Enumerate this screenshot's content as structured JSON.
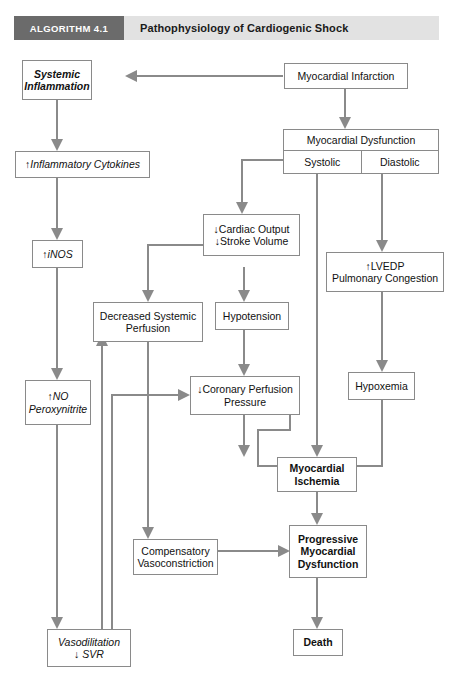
{
  "header": {
    "tag": "ALGORITHM 4.1",
    "title": "Pathophysiology of Cardiogenic Shock",
    "tag_bg": "#6b6b6b",
    "band_bg": "#e2e2e2"
  },
  "theme": {
    "box_border": "#8a8a8a",
    "arrow_color": "#8a8a8a",
    "text_color": "#111111",
    "page_bg": "#ffffff"
  },
  "nodes": {
    "myocardial_infarction": {
      "lines": [
        "Myocardial Infarction"
      ]
    },
    "systemic_inflammation": {
      "lines": [
        "Systemic",
        "Inflammation"
      ]
    },
    "inflammatory_cytokines": {
      "lines": [
        "↑Inflammatory Cytokines"
      ]
    },
    "inos": {
      "lines": [
        "↑iNOS"
      ]
    },
    "no_peroxynitrite": {
      "lines": [
        "↑NO",
        "Peroxynitrite"
      ]
    },
    "vasodilitation": {
      "lines": [
        "Vasodilitation",
        "↓ SVR"
      ]
    },
    "myocardial_dysfunction": {
      "title": "Myocardial Dysfunction",
      "left_cell": "Systolic",
      "right_cell": "Diastolic"
    },
    "cardiac_output": {
      "lines": [
        "↓Cardiac Output",
        "↓Stroke Volume"
      ]
    },
    "lvedp": {
      "lines": [
        "↑LVEDP",
        "Pulmonary Congestion"
      ]
    },
    "decreased_perfusion": {
      "lines": [
        "Decreased Systemic",
        "Perfusion"
      ]
    },
    "hypotension": {
      "lines": [
        "Hypotension"
      ]
    },
    "hypoxemia": {
      "lines": [
        "Hypoxemia"
      ]
    },
    "coronary_perfusion": {
      "lines": [
        "↓Coronary Perfusion",
        "Pressure"
      ]
    },
    "myocardial_ischemia": {
      "lines": [
        "Myocardial",
        "Ischemia"
      ]
    },
    "compensatory_vaso": {
      "lines": [
        "Compensatory",
        "Vasoconstriction"
      ]
    },
    "progressive_dysfunction": {
      "lines": [
        "Progressive",
        "Myocardial",
        "Dysfunction"
      ]
    },
    "death": {
      "lines": [
        "Death"
      ]
    }
  },
  "flow_edges": [
    "Myocardial Infarction → Systemic Inflammation",
    "Myocardial Infarction → Myocardial Dysfunction",
    "Systemic Inflammation → ↑Inflammatory Cytokines",
    "↑Inflammatory Cytokines → ↑iNOS",
    "↑iNOS → ↑NO Peroxynitrite",
    "↑NO Peroxynitrite → Vasodilitation ↓ SVR",
    "Systolic → ↓Cardiac Output ↓Stroke Volume",
    "Systolic → Myocardial Ischemia",
    "Diastolic → ↑LVEDP Pulmonary Congestion",
    "↓Cardiac Output → Decreased Systemic Perfusion",
    "↓Cardiac Output → Hypotension",
    "↑LVEDP Pulmonary Congestion → Hypoxemia",
    "Hypotension → ↓Coronary Perfusion Pressure",
    "Hypoxemia → Myocardial Ischemia",
    "↓Coronary Perfusion Pressure → Myocardial Ischemia",
    "Decreased Systemic Perfusion → Compensatory Vasoconstriction",
    "Compensatory Vasoconstriction → Progressive Myocardial Dysfunction",
    "Myocardial Ischemia → Progressive Myocardial Dysfunction",
    "Progressive Myocardial Dysfunction → Death",
    "Vasodilitation ↓ SVR → Decreased Systemic Perfusion",
    "Vasodilitation ↓ SVR → ↓Coronary Perfusion Pressure",
    "Myocardial Dysfunction → Systemic Inflammation"
  ]
}
